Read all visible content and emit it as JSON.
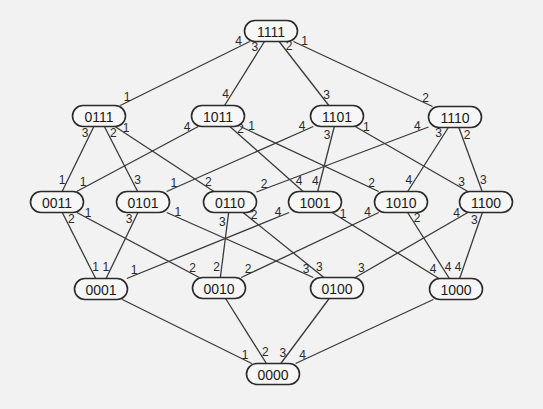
{
  "diagram": {
    "type": "boolean-lattice",
    "node_size": {
      "width": 53,
      "height": 21
    },
    "colors": {
      "background": "#f2f2f2",
      "edge": "#3a3a3a",
      "node_border": "#2a2a2a",
      "text": "#1a1a1a"
    },
    "nodes": [
      {
        "id": "1111",
        "label": "1111",
        "x": 271,
        "y": 31
      },
      {
        "id": "0111",
        "label": "0111",
        "x": 99,
        "y": 116
      },
      {
        "id": "1011",
        "label": "1011",
        "x": 218,
        "y": 116
      },
      {
        "id": "1101",
        "label": "1101",
        "x": 337,
        "y": 116
      },
      {
        "id": "1110",
        "label": "1110",
        "x": 455,
        "y": 117
      },
      {
        "id": "0011",
        "label": "0011",
        "x": 57,
        "y": 202
      },
      {
        "id": "0101",
        "label": "0101",
        "x": 143,
        "y": 202
      },
      {
        "id": "0110",
        "label": "0110",
        "x": 230,
        "y": 202
      },
      {
        "id": "1001",
        "label": "1001",
        "x": 315,
        "y": 202
      },
      {
        "id": "1010",
        "label": "1010",
        "x": 401,
        "y": 202
      },
      {
        "id": "1100",
        "label": "1100",
        "x": 486,
        "y": 202
      },
      {
        "id": "0001",
        "label": "0001",
        "x": 101,
        "y": 289
      },
      {
        "id": "0010",
        "label": "0010",
        "x": 219,
        "y": 288
      },
      {
        "id": "0100",
        "label": "0100",
        "x": 337,
        "y": 288
      },
      {
        "id": "1000",
        "label": "1000",
        "x": 456,
        "y": 289
      },
      {
        "id": "0000",
        "label": "0000",
        "x": 273,
        "y": 374
      }
    ],
    "edges": [
      {
        "from": "1111",
        "to": "0111",
        "label_from": "4",
        "label_to": "1"
      },
      {
        "from": "1111",
        "to": "1011",
        "label_from": "3",
        "label_to": "4"
      },
      {
        "from": "1111",
        "to": "1101",
        "label_from": "2",
        "label_to": "3"
      },
      {
        "from": "1111",
        "to": "1110",
        "label_from": "1",
        "label_to": "2"
      },
      {
        "from": "0111",
        "to": "0011",
        "label_from": "3",
        "label_to": "1"
      },
      {
        "from": "0111",
        "to": "0101",
        "label_from": "2",
        "label_to": "3"
      },
      {
        "from": "0111",
        "to": "0110",
        "label_from": "1",
        "label_to": "2"
      },
      {
        "from": "1011",
        "to": "0011",
        "label_from": "4",
        "label_to": "1"
      },
      {
        "from": "1011",
        "to": "1001",
        "label_from": "2",
        "label_to": "4"
      },
      {
        "from": "1011",
        "to": "1010",
        "label_from": "1",
        "label_to": "2"
      },
      {
        "from": "1101",
        "to": "0101",
        "label_from": "4",
        "label_to": "1"
      },
      {
        "from": "1101",
        "to": "1001",
        "label_from": "3",
        "label_to": "4"
      },
      {
        "from": "1101",
        "to": "1100",
        "label_from": "1",
        "label_to": "3"
      },
      {
        "from": "1110",
        "to": "0110",
        "label_from": "4",
        "label_to": "2"
      },
      {
        "from": "1110",
        "to": "1010",
        "label_from": "3",
        "label_to": "4"
      },
      {
        "from": "1110",
        "to": "1100",
        "label_from": "2",
        "label_to": "3"
      },
      {
        "from": "0011",
        "to": "0001",
        "label_from": "2",
        "label_to": "1"
      },
      {
        "from": "0011",
        "to": "0010",
        "label_from": "1",
        "label_to": "2"
      },
      {
        "from": "0101",
        "to": "0001",
        "label_from": "3",
        "label_to": "1"
      },
      {
        "from": "0101",
        "to": "0100",
        "label_from": "1",
        "label_to": "3"
      },
      {
        "from": "0110",
        "to": "0010",
        "label_from": "3",
        "label_to": "2"
      },
      {
        "from": "0110",
        "to": "0100",
        "label_from": "2",
        "label_to": "3"
      },
      {
        "from": "1001",
        "to": "0001",
        "label_from": "4",
        "label_to": "1"
      },
      {
        "from": "1001",
        "to": "1000",
        "label_from": "1",
        "label_to": "4"
      },
      {
        "from": "1010",
        "to": "0010",
        "label_from": "4",
        "label_to": "2"
      },
      {
        "from": "1010",
        "to": "1000",
        "label_from": "2",
        "label_to": "4"
      },
      {
        "from": "1100",
        "to": "0100",
        "label_from": "4",
        "label_to": "3"
      },
      {
        "from": "1100",
        "to": "1000",
        "label_from": "3",
        "label_to": "4"
      },
      {
        "from": "0001",
        "to": "0000",
        "label_from": "",
        "label_to": "1"
      },
      {
        "from": "0010",
        "to": "0000",
        "label_from": "",
        "label_to": "2"
      },
      {
        "from": "0100",
        "to": "0000",
        "label_from": "",
        "label_to": "3"
      },
      {
        "from": "1000",
        "to": "0000",
        "label_from": "",
        "label_to": "4"
      }
    ]
  }
}
